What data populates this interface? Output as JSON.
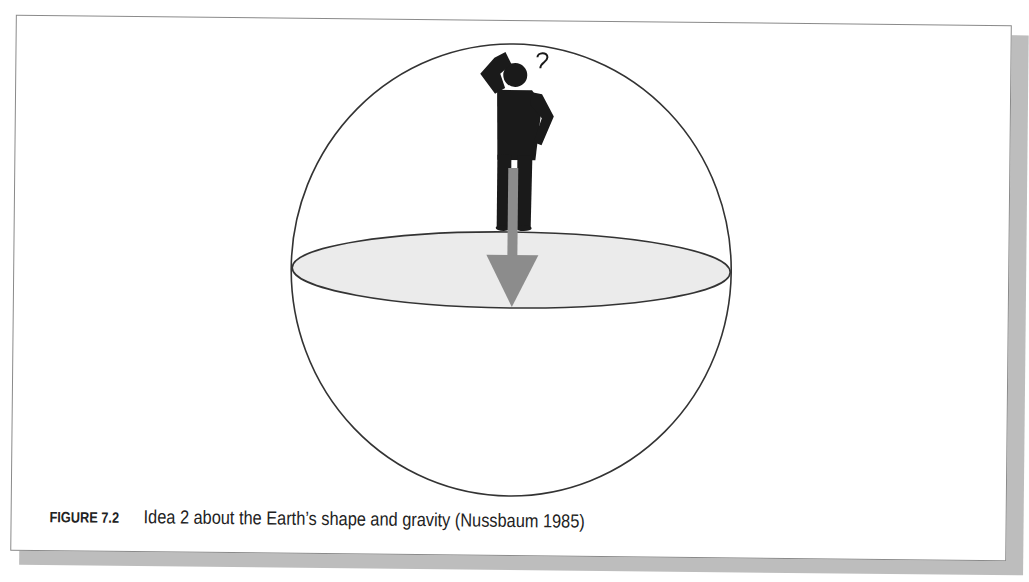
{
  "figure": {
    "label": "FIGURE 7.2",
    "caption": "Idea 2 about the Earth’s shape and gravity (Nussbaum 1985)"
  },
  "diagram": {
    "earth_sphere": {
      "cx": 511,
      "cy": 270,
      "rx": 220,
      "ry": 226,
      "stroke": "#333333"
    },
    "equatorial_plane": {
      "cx": 511,
      "cy": 270,
      "rx": 219,
      "ry": 38,
      "fill": "#ebebeb",
      "stroke": "#333333"
    },
    "person": {
      "fill": "#1a1a1a",
      "thought_symbol": "?"
    },
    "gravity_arrow": {
      "color": "#8c8c8c",
      "direction": "down"
    }
  },
  "colors": {
    "frame_border": "#8a8a8a",
    "shadow": "#bdbdbd",
    "text": "#222222"
  }
}
